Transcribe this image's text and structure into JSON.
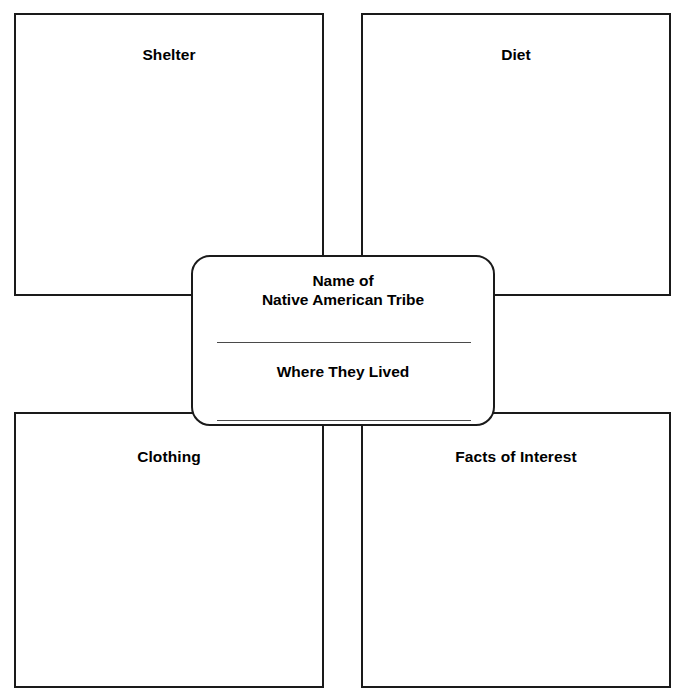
{
  "worksheet": {
    "type": "graphic-organizer",
    "layout": "four-quadrant web with central hub",
    "center": {
      "title_line_1": "Name of",
      "title_line_2": "Native American Tribe",
      "subtitle": "Where They Lived",
      "blank_lines": 2
    },
    "quadrants": [
      {
        "id": "shelter",
        "label": "Shelter",
        "position": "top-left"
      },
      {
        "id": "diet",
        "label": "Diet",
        "position": "top-right"
      },
      {
        "id": "clothing",
        "label": "Clothing",
        "position": "bottom-left"
      },
      {
        "id": "facts-of-interest",
        "label": "Facts of Interest",
        "position": "bottom-right"
      }
    ]
  },
  "colors": {
    "ink": "#1a1a1a",
    "rule": "#4a4a4a",
    "paper": "#ffffff"
  }
}
